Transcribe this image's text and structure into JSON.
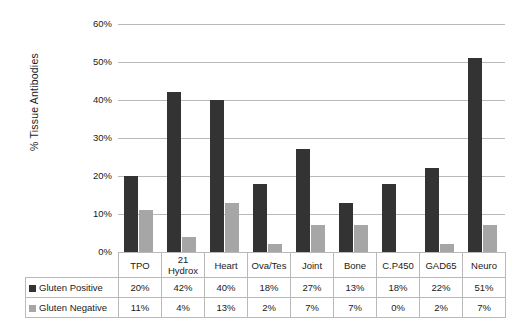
{
  "chart_data": {
    "type": "bar",
    "title": "",
    "xlabel": "",
    "ylabel": "% Tissue Antibodies",
    "ylim": [
      0,
      60
    ],
    "ytick_labels": [
      "60%",
      "50%",
      "40%",
      "30%",
      "20%",
      "10%",
      "0%"
    ],
    "ytick_values": [
      60,
      50,
      40,
      30,
      20,
      10,
      0
    ],
    "grid": true,
    "legend_position": "table-row-headers",
    "categories": [
      "TPO",
      "21 Hydrox",
      "Heart",
      "Ova/Tes",
      "Joint",
      "Bone",
      "C.P450",
      "GAD65",
      "Neuro"
    ],
    "category_lines": [
      [
        "TPO"
      ],
      [
        "21",
        "Hydrox"
      ],
      [
        "Heart"
      ],
      [
        "Ova/Tes"
      ],
      [
        "Joint"
      ],
      [
        "Bone"
      ],
      [
        "C.P450"
      ],
      [
        "GAD65"
      ],
      [
        "Neuro"
      ]
    ],
    "series": [
      {
        "name": "Gluten Positive",
        "color": "#333333",
        "values": [
          20,
          42,
          40,
          18,
          27,
          13,
          18,
          22,
          51
        ],
        "labels": [
          "20%",
          "42%",
          "40%",
          "18%",
          "27%",
          "13%",
          "18%",
          "22%",
          "51%"
        ]
      },
      {
        "name": "Gluten Negative",
        "color": "#a6a6a6",
        "values": [
          11,
          4,
          13,
          2,
          7,
          7,
          0,
          2,
          7
        ],
        "labels": [
          "11%",
          "4%",
          "13%",
          "2%",
          "7%",
          "7%",
          "0%",
          "2%",
          "7%"
        ]
      }
    ]
  },
  "table": {
    "row_header_corner": ""
  },
  "colors": {
    "positive": "#333333",
    "negative": "#a6a6a6",
    "gridline": "#b9b9b9",
    "border": "#b9b9b9",
    "background": "#ffffff",
    "text": "#1a1a1a"
  }
}
